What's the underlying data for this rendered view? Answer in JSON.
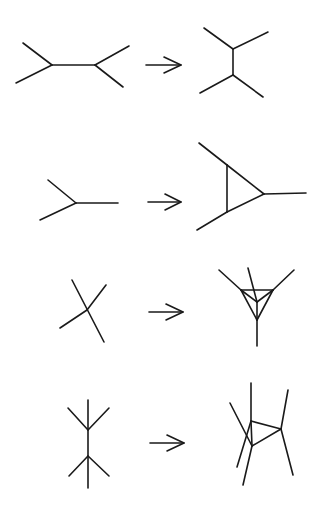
{
  "diagram": {
    "title": "",
    "stroke_color": "#1a1a1a",
    "background": "#ffffff",
    "rows": [
      {
        "id": "row-1",
        "before": {
          "name": "tree-two-vertices-horizontal",
          "segments": [
            [
              23,
              43,
              52,
              65
            ],
            [
              16,
              83,
              52,
              65
            ],
            [
              52,
              65,
              95,
              65
            ],
            [
              95,
              65,
              129,
              46
            ],
            [
              95,
              65,
              123,
              87
            ]
          ]
        },
        "arrow": {
          "from": [
            146,
            65
          ],
          "to": [
            181,
            65
          ],
          "head": [
            [
              164,
              57
            ],
            [
              181,
              65
            ],
            [
              164,
              73
            ]
          ]
        },
        "after": {
          "name": "tree-two-vertices-vertical",
          "segments": [
            [
              204,
              28,
              233,
              49
            ],
            [
              233,
              49,
              268,
              32
            ],
            [
              233,
              49,
              233,
              75
            ],
            [
              233,
              75,
              200,
              93
            ],
            [
              233,
              75,
              263,
              97
            ]
          ]
        }
      },
      {
        "id": "row-2",
        "before": {
          "name": "single-trivalent-vertex",
          "segments": [
            [
              48,
              180,
              76,
              203
            ],
            [
              40,
              220,
              76,
              203
            ],
            [
              76,
              203,
              118,
              203
            ]
          ]
        },
        "arrow": {
          "from": [
            148,
            202
          ],
          "to": [
            181,
            202
          ],
          "head": [
            [
              165,
              194
            ],
            [
              181,
              202
            ],
            [
              165,
              210
            ]
          ]
        },
        "after": {
          "name": "triangle-loop-three-legs",
          "segments": [
            [
              199,
              143,
              227,
              165
            ],
            [
              227,
              165,
              264,
              194
            ],
            [
              227,
              165,
              227,
              212
            ],
            [
              227,
              212,
              264,
              194
            ],
            [
              227,
              212,
              197,
              230
            ],
            [
              264,
              194,
              306,
              193
            ]
          ]
        }
      },
      {
        "id": "row-3",
        "before": {
          "name": "four-valent-crossing-vertex",
          "segments": [
            [
              72,
              280,
              104,
              342
            ],
            [
              60,
              328,
              87,
              310
            ],
            [
              87,
              310,
              106,
              285
            ]
          ]
        },
        "arrow": {
          "from": [
            149,
            312
          ],
          "to": [
            183,
            312
          ],
          "head": [
            [
              166,
              304
            ],
            [
              183,
              312
            ],
            [
              166,
              320
            ]
          ]
        },
        "after": {
          "name": "tetrahedron-with-four-legs",
          "segments": [
            [
              219,
              270,
              241,
              290
            ],
            [
              294,
              270,
              273,
              290
            ],
            [
              241,
              290,
              273,
              290
            ],
            [
              241,
              290,
              257,
              320
            ],
            [
              273,
              290,
              257,
              320
            ],
            [
              241,
              290,
              257,
              302
            ],
            [
              273,
              290,
              257,
              302
            ],
            [
              257,
              320,
              257,
              302
            ],
            [
              248,
              268,
              257,
              302
            ],
            [
              257,
              320,
              257,
              346
            ]
          ]
        }
      },
      {
        "id": "row-4",
        "before": {
          "name": "two-four-valent-vertices-vertical",
          "segments": [
            [
              88,
              400,
              88,
              488
            ],
            [
              88,
              430,
              68,
              408
            ],
            [
              88,
              430,
              109,
              408
            ],
            [
              88,
              456,
              69,
              476
            ],
            [
              88,
              456,
              109,
              476
            ]
          ]
        },
        "arrow": {
          "from": [
            150,
            443
          ],
          "to": [
            184,
            443
          ],
          "head": [
            [
              167,
              435
            ],
            [
              184,
              443
            ],
            [
              167,
              451
            ]
          ]
        },
        "after": {
          "name": "triangle-with-six-legs",
          "segments": [
            [
              251,
              383,
              251,
              421
            ],
            [
              251,
              421,
              281,
              429
            ],
            [
              281,
              429,
              252,
              446
            ],
            [
              252,
              446,
              251,
              421
            ],
            [
              230,
              403,
              252,
              446
            ],
            [
              251,
              421,
              237,
              467
            ],
            [
              252,
              446,
              243,
              485
            ],
            [
              281,
              429,
              288,
              390
            ],
            [
              281,
              429,
              293,
              475
            ]
          ]
        }
      }
    ]
  }
}
